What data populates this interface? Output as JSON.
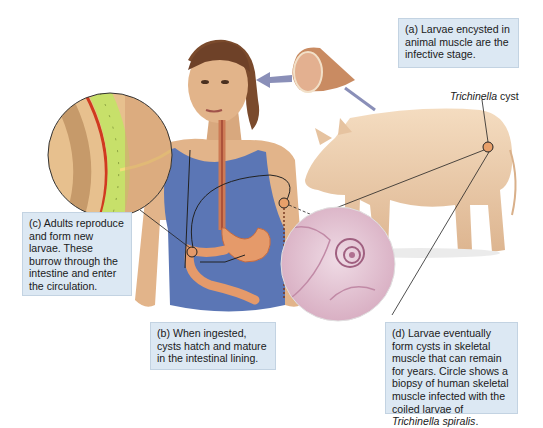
{
  "figure": {
    "colors": {
      "caption_bg": "#dce8f3",
      "caption_border": "#c3d3e2",
      "skin": "#e2b48a",
      "shirt": "#5b76b5",
      "pig": "#efcfae",
      "stomach": "#e59a6a",
      "biopsy": "#e3c3d3",
      "arrow": "#8a8fb8"
    },
    "captions": {
      "a": "(a) Larvae encysted in animal muscle are the infective stage.",
      "b": "(b) When ingested, cysts hatch and mature in the intestinal lining.",
      "c": "(c) Adults reproduce and form new larvae. These burrow through the intestine and enter the circulation.",
      "d_main": "(d) Larvae eventually form cysts in skeletal muscle that can remain for years. Circle shows a biopsy of human skeletal muscle infected with the coiled larvae of ",
      "d_italic": "Trichinella spiralis",
      "d_end": "."
    },
    "labels": {
      "cyst_italic": "Trichinella",
      "cyst_rest": " cyst"
    }
  }
}
